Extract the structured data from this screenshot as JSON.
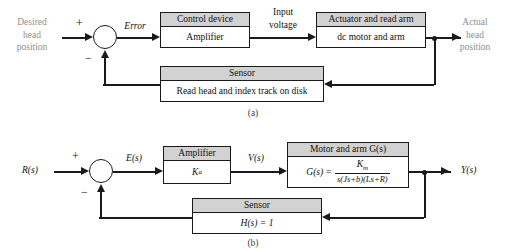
{
  "figure": {
    "panels": [
      {
        "caption": "(a)",
        "input_label": "Desired\nhead\nposition",
        "output_label": "Actual\nhead\nposition",
        "error_label": "Error",
        "signal_label": "Input\nvoltage",
        "plus_sign": "+",
        "minus_sign": "−",
        "blocks": [
          {
            "header": "Control device",
            "body": "Amplifier"
          },
          {
            "header": "Actuator and read arm",
            "body": "dc motor and arm"
          },
          {
            "header": "Sensor",
            "body": "Read head and index track on disk"
          }
        ]
      },
      {
        "caption": "(b)",
        "input_label": "R(s)",
        "output_label": "Y(s)",
        "error_label": "E(s)",
        "signal_label": "V(s)",
        "plus_sign": "+",
        "minus_sign": "−",
        "blocks": [
          {
            "header": "Amplifier",
            "body": "Kₐ"
          },
          {
            "header": "Motor and arm G(s)",
            "body": "G(s) ="
          },
          {
            "header": "Sensor",
            "body": "H(s) = 1"
          }
        ],
        "transfer_function": {
          "lhs": "G(s) =",
          "numerator": "K",
          "numerator_sub": "m",
          "denominator": "s(Js+b)(Ls+R)"
        },
        "amplifier_gain": {
          "symbol": "K",
          "subscript": "a"
        }
      }
    ]
  },
  "colors": {
    "header_fill": "#d2d2d2",
    "line": "#1a1a1a",
    "faded_text": "#8e8e8e"
  }
}
